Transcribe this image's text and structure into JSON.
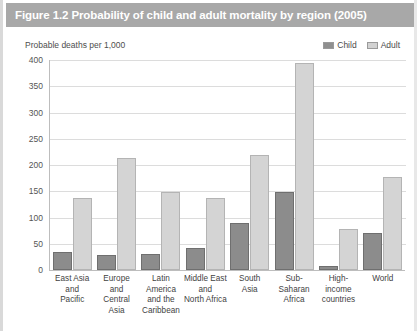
{
  "figure": {
    "title": "Figure 1.2 Probability of child and adult mortality by region (2005)",
    "title_bar_color": "#a8a8a8",
    "title_text_color": "#ffffff",
    "background": "#ffffff"
  },
  "legend": {
    "position": "top-right",
    "entries": [
      {
        "label": "Child",
        "color": "#8c8c8c"
      },
      {
        "label": "Adult",
        "color": "#d4d4d4"
      }
    ]
  },
  "axes": {
    "ylabel": "Probable deaths per 1,000",
    "yticks": [
      "0",
      "50",
      "100",
      "150",
      "200",
      "250",
      "300",
      "350",
      "400"
    ]
  },
  "chart_data": {
    "type": "bar",
    "title": "Figure 1.2 Probability of child and adult mortality by region (2005)",
    "xlabel": "",
    "ylabel": "Probable deaths per 1,000",
    "ylim": [
      0,
      400
    ],
    "ytick_step": 50,
    "grid": true,
    "legend_position": "top-right",
    "categories": [
      "East Asia and Pacific",
      "Europe and Central Asia",
      "Latin America and the Caribbean",
      "Middle East and North Africa",
      "South Asia",
      "Sub-Saharan Africa",
      "High-income countries",
      "World"
    ],
    "category_lines": [
      [
        "East Asia",
        "and",
        "Pacific"
      ],
      [
        "Europe",
        "and",
        "Central",
        "Asia"
      ],
      [
        "Latin",
        "America",
        "and the",
        "Caribbean"
      ],
      [
        "Middle East",
        "and",
        "North Africa"
      ],
      [
        "South",
        "Asia"
      ],
      [
        "Sub-",
        "Saharan",
        "Africa"
      ],
      [
        "High-",
        "income",
        "countries"
      ],
      [
        "World"
      ]
    ],
    "series": [
      {
        "name": "Child",
        "color": "#8c8c8c",
        "values": [
          35,
          28,
          31,
          42,
          89,
          149,
          8,
          71
        ]
      },
      {
        "name": "Adult",
        "color": "#d4d4d4",
        "values": [
          137,
          213,
          148,
          137,
          219,
          395,
          78,
          177
        ]
      }
    ]
  }
}
